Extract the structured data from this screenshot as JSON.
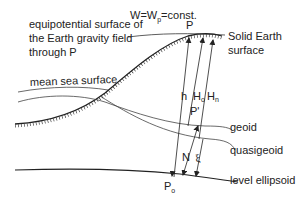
{
  "labels": {
    "equipotential_line1": "equipotential surface of",
    "equipotential_line2": "the Earth gravity field",
    "equipotential_line3": "through P",
    "equation_prefix": "W=W",
    "equation_sub": "p",
    "equation_suffix": "=const.",
    "point_p": "P",
    "solid_earth_line1": "Solid Earth",
    "solid_earth_line2": "surface",
    "mean_sea": "mean sea surface",
    "h": "h",
    "Ho_main": "H",
    "Ho_sub": "o",
    "Hn_main": "H",
    "Hn_sub": "n",
    "point_p_prime": "P'",
    "geoid": "geoid",
    "N": "N",
    "xi": "ξ",
    "quasigeoid": "quasigeoid",
    "level_ellipsoid": "level ellipsoid",
    "p0_main": "P",
    "p0_sub": "o"
  },
  "colors": {
    "line": "#222222",
    "thin_line": "#444444"
  }
}
